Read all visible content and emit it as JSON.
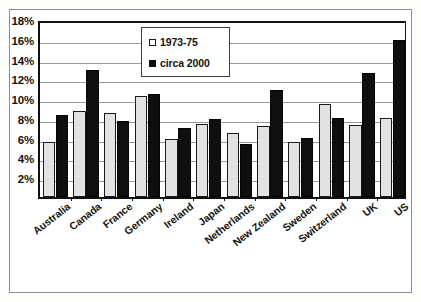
{
  "chart_data": {
    "type": "bar",
    "title": "",
    "xlabel": "",
    "ylabel": "",
    "ylim": [
      0,
      18
    ],
    "ytick_values": [
      0,
      2,
      4,
      6,
      8,
      10,
      12,
      14,
      16,
      18
    ],
    "ytick_labels": [
      "0%",
      "2%",
      "4%",
      "6%",
      "8%",
      "10%",
      "12%",
      "14%",
      "16%",
      "18%"
    ],
    "grid": true,
    "legend_position": "upper-center",
    "categories": [
      "Australia",
      "Canada",
      "France",
      "Germany",
      "Ireland",
      "Japan",
      "Netherlands",
      "New Zealand",
      "Sweden",
      "Switzerland",
      "UK",
      "US"
    ],
    "series": [
      {
        "name": "1973-75",
        "color": "#e2e2e2",
        "values": [
          5.6,
          8.7,
          8.5,
          10.2,
          5.9,
          7.4,
          6.5,
          7.2,
          5.6,
          9.4,
          7.3,
          8.0
        ]
      },
      {
        "name": "circa 2000",
        "color": "#100f0d",
        "values": [
          8.3,
          12.8,
          7.7,
          10.4,
          7.0,
          7.9,
          5.4,
          10.8,
          6.0,
          8.0,
          12.5,
          15.9
        ]
      }
    ]
  },
  "legend": {
    "items": [
      {
        "label": "1973-75"
      },
      {
        "label": "circa 2000"
      }
    ]
  }
}
